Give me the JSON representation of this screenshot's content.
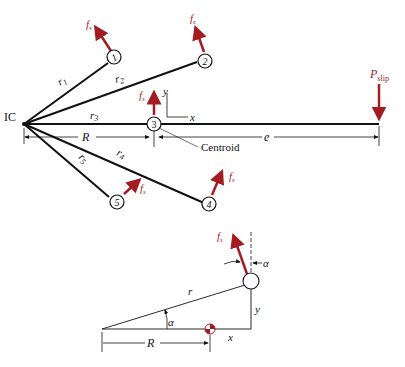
{
  "colors": {
    "force": "#a31c22",
    "line": "#111111"
  },
  "top_diagram": {
    "ic_label": "IC",
    "bolts": [
      {
        "id": "1",
        "radius_label": "r",
        "radius_sub": "1",
        "force_label": "f",
        "force_sub": "s"
      },
      {
        "id": "2",
        "radius_label": "r",
        "radius_sub": "2",
        "force_label": "f",
        "force_sub": "s"
      },
      {
        "id": "3",
        "radius_label": "r",
        "radius_sub": "3",
        "force_label": "f",
        "force_sub": "s"
      },
      {
        "id": "4",
        "radius_label": "r",
        "radius_sub": "4",
        "force_label": "f",
        "force_sub": "s"
      },
      {
        "id": "5",
        "radius_label": "r",
        "radius_sub": "5",
        "force_label": "f",
        "force_sub": "s"
      }
    ],
    "axis_y": "y",
    "axis_x": "x",
    "dim_R": "R",
    "dim_e": "e",
    "centroid_label": "Centroid",
    "load_label": "P",
    "load_sub": "slip"
  },
  "bottom_diagram": {
    "force_label": "f",
    "force_sub": "s",
    "alpha_top": "α",
    "alpha_angle": "α",
    "r_label": "r",
    "y_label": "y",
    "x_label": "x",
    "R_label": "R"
  }
}
